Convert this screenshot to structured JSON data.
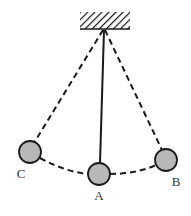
{
  "diagram": {
    "type": "pendulum",
    "colors": {
      "line": "#1a1a1a",
      "ball_fill": "#b8b8b8",
      "ball_stroke": "#1a1a1a",
      "label": "#333333"
    },
    "support": {
      "x": 80,
      "y": 12,
      "width": 50,
      "height": 17
    },
    "pivot": {
      "x": 104,
      "y": 29
    },
    "positions": [
      {
        "label": "C",
        "cx": 30,
        "cy": 152,
        "r": 11,
        "label_x": 21,
        "label_y": 178,
        "string": "dashed"
      },
      {
        "label": "A",
        "cx": 99,
        "cy": 174,
        "r": 11,
        "label_x": 99,
        "label_y": 200,
        "string": "solid"
      },
      {
        "label": "B",
        "cx": 166,
        "cy": 160,
        "r": 11,
        "label_x": 176,
        "label_y": 186,
        "string": "dashed"
      }
    ],
    "arc_path": "dashed"
  }
}
